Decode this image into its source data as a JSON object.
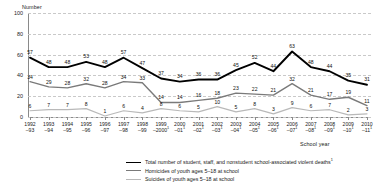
{
  "chart_data": {
    "type": "line",
    "title": "",
    "xlabel": "School year",
    "ylabel": "Number",
    "ylim": [
      0,
      100
    ],
    "yticks": [
      0,
      20,
      40,
      60,
      80,
      100
    ],
    "grid": true,
    "legend_position": "bottom",
    "categories": [
      "1992–93",
      "1993–94",
      "1994–95",
      "1995–96",
      "1996–97",
      "1997–98",
      "1998–99",
      "1999–2000",
      "2000–01",
      "2001–02",
      "2002–03",
      "2003–04",
      "2004–05",
      "2005–06",
      "2006–07",
      "2007–08",
      "2008–09",
      "2009–10",
      "2010–11"
    ],
    "categories_top": [
      "1992",
      "1993",
      "1994",
      "1995",
      "1996",
      "1997",
      "1998",
      "1999",
      "2000",
      "2001",
      "2002",
      "2003",
      "2004",
      "2005",
      "2006",
      "2007",
      "2008",
      "2009",
      "2010"
    ],
    "categories_bottom": [
      "–93",
      "–94",
      "–95",
      "–96",
      "–97",
      "–98",
      "–99",
      "–2000",
      "–01",
      "–02",
      "–03",
      "–04",
      "–05",
      "–06",
      "–07",
      "–08",
      "–09",
      "–10",
      "–11"
    ],
    "series": [
      {
        "name": "Total number of student, staff, and nonstudent school-associated violent deaths",
        "color": "#000000",
        "values": [
          57,
          48,
          48,
          53,
          48,
          57,
          47,
          37,
          34,
          36,
          36,
          45,
          52,
          44,
          63,
          48,
          44,
          35,
          31
        ]
      },
      {
        "name": "Homicides of youth ages 5–18 at school",
        "color": "#7a7a7a",
        "values": [
          34,
          29,
          28,
          32,
          28,
          34,
          33,
          14,
          14,
          16,
          18,
          23,
          22,
          21,
          32,
          21,
          17,
          19,
          11
        ]
      },
      {
        "name": "Suicides of youth ages 5–18 at school",
        "color": "#b9b9b9",
        "values": [
          6,
          7,
          7,
          8,
          1,
          6,
          4,
          8,
          6,
          5,
          10,
          5,
          8,
          3,
          9,
          6,
          7,
          2,
          3
        ]
      }
    ]
  },
  "legend": {
    "items": [
      {
        "label": "Total number of student, staff, and nonstudent school-associated violent deaths",
        "footnote": "1"
      },
      {
        "label": "Homicides of youth ages 5–18 at school",
        "footnote": ""
      },
      {
        "label": "Suicides of youth ages 5–18 at school",
        "footnote": ""
      }
    ]
  },
  "footnote_marks": {
    "2000": "1",
    "2001": "1",
    "2002": "1",
    "2003": "1",
    "2004": "1",
    "2005": "1",
    "2006": "1",
    "2007": "1",
    "2008": "1",
    "2009": "1",
    "2010": "1",
    "2011": "1"
  }
}
